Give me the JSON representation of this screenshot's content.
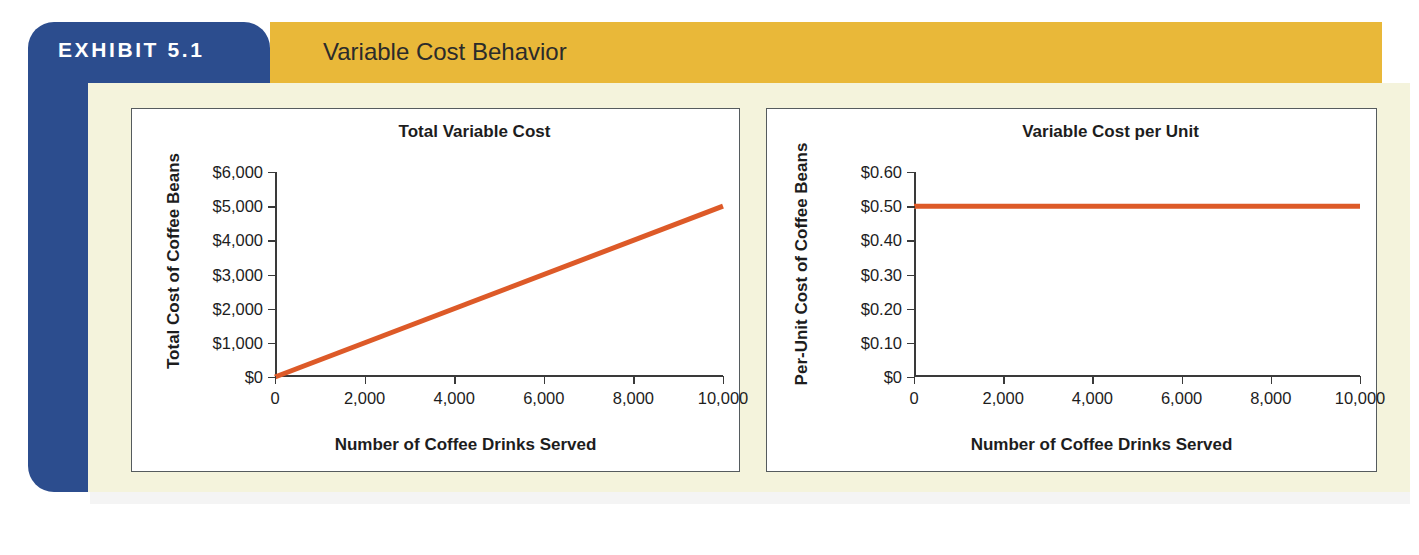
{
  "exhibit": {
    "tab_label": "EXHIBIT 5.1",
    "title": "Variable Cost Behavior",
    "colors": {
      "tab_blue": "#2c4d8e",
      "band_gold": "#e9b839",
      "panel_cream": "#f4f3dc",
      "line_orange": "#dd5a28",
      "axis": "#3a3a3a"
    }
  },
  "chart_data": [
    {
      "id": "total-variable-cost",
      "type": "line",
      "title": "Total Variable Cost",
      "xlabel": "Number of Coffee Drinks Served",
      "ylabel": "Total Cost of Coffee Beans",
      "x": [
        0,
        10000
      ],
      "values": [
        0,
        5000
      ],
      "xlim": [
        0,
        10000
      ],
      "ylim": [
        0,
        6000
      ],
      "xticks": [
        0,
        2000,
        4000,
        6000,
        8000,
        10000
      ],
      "xticklabels": [
        "0",
        "2,000",
        "4,000",
        "6,000",
        "8,000",
        "10,000"
      ],
      "yticks": [
        0,
        1000,
        2000,
        3000,
        4000,
        5000,
        6000
      ],
      "yticklabels": [
        "$0",
        "$1,000",
        "$2,000",
        "$3,000",
        "$4,000",
        "$5,000",
        "$6,000"
      ],
      "series_color": "#dd5a28",
      "grid": false,
      "legend": "none"
    },
    {
      "id": "variable-cost-per-unit",
      "type": "line",
      "title": "Variable Cost per Unit",
      "xlabel": "Number of Coffee Drinks Served",
      "ylabel": "Per-Unit Cost of Coffee Beans",
      "x": [
        0,
        10000
      ],
      "values": [
        0.5,
        0.5
      ],
      "xlim": [
        0,
        10000
      ],
      "ylim": [
        0,
        0.6
      ],
      "xticks": [
        0,
        2000,
        4000,
        6000,
        8000,
        10000
      ],
      "xticklabels": [
        "0",
        "2,000",
        "4,000",
        "6,000",
        "8,000",
        "10,000"
      ],
      "yticks": [
        0,
        0.1,
        0.2,
        0.3,
        0.4,
        0.5,
        0.6
      ],
      "yticklabels": [
        "$0",
        "$0.10",
        "$0.20",
        "$0.30",
        "$0.40",
        "$0.50",
        "$0.60"
      ],
      "series_color": "#dd5a28",
      "grid": false,
      "legend": "none"
    }
  ]
}
